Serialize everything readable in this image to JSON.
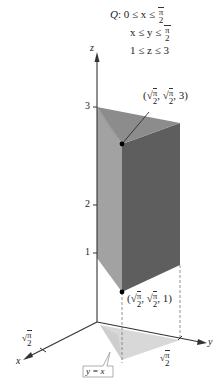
{
  "region": {
    "name": "Q",
    "constraints": [
      {
        "lhs": "0 ≤ x ≤",
        "rhs_num": "π",
        "rhs_den": "2"
      },
      {
        "lhs": "x ≤ y ≤",
        "rhs_num": "π",
        "rhs_den": "2"
      },
      {
        "lhs": "1 ≤ z ≤ 3"
      }
    ]
  },
  "axes": {
    "z_label": "z",
    "x_label": "x",
    "y_label": "y",
    "z_ticks": [
      "1",
      "2",
      "3"
    ],
    "x_tick": {
      "num": "π",
      "den": "2"
    },
    "y_tick": {
      "num": "π",
      "den": "2"
    }
  },
  "points": {
    "top": {
      "x_num": "π",
      "x_den": "2",
      "y_num": "π",
      "y_den": "2",
      "z": "3"
    },
    "bottom": {
      "x_num": "π",
      "x_den": "2",
      "y_num": "π",
      "y_den": "2",
      "z": "1"
    }
  },
  "callout": {
    "label": "y = x"
  },
  "colors": {
    "top_face": "#8a8a8a",
    "left_face": "#9c9c9c",
    "front_face": "#5a5a5a",
    "shadow": "#d6d6d6",
    "axis": "#333333"
  }
}
